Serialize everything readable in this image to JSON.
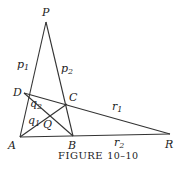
{
  "figure": {
    "caption": "Figure 10–10",
    "caption_small": "FIGURE",
    "caption_num": "10–10"
  },
  "points": {
    "P": {
      "label": "P",
      "x": 46,
      "y": 22
    },
    "D": {
      "label": "D",
      "x": 24,
      "y": 93
    },
    "C": {
      "label": "C",
      "x": 67,
      "y": 104
    },
    "A": {
      "label": "A",
      "x": 20,
      "y": 137
    },
    "B": {
      "label": "B",
      "x": 73,
      "y": 136
    },
    "R": {
      "label": "R",
      "x": 170,
      "y": 134
    },
    "Q": {
      "label": "Q",
      "x": 62,
      "y": 119
    }
  },
  "lines": [
    {
      "from": "P",
      "to": "A",
      "label": "p1"
    },
    {
      "from": "P",
      "to": "B",
      "label": "p2"
    },
    {
      "from": "D",
      "to": "R",
      "label": "r1"
    },
    {
      "from": "A",
      "to": "R",
      "label": "r2"
    },
    {
      "from": "D",
      "to": "B",
      "label": "q2"
    },
    {
      "from": "A",
      "to": "C",
      "label": "q1"
    }
  ],
  "line_labels": {
    "p1": {
      "base": "p",
      "sub": "1"
    },
    "p2": {
      "base": "p",
      "sub": "2"
    },
    "q1": {
      "base": "q",
      "sub": "1"
    },
    "q2": {
      "base": "q",
      "sub": "2"
    },
    "r1": {
      "base": "r",
      "sub": "1"
    },
    "r2": {
      "base": "r",
      "sub": "2"
    }
  }
}
